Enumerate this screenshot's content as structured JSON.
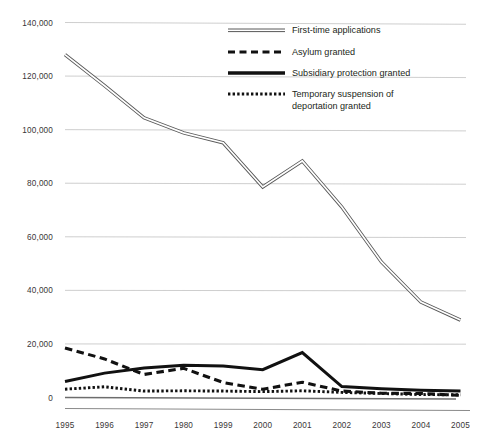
{
  "chart_data": {
    "type": "line",
    "title": "",
    "subtitle": "",
    "xlabel": "",
    "ylabel": "",
    "xlim": [
      0,
      10
    ],
    "ylim": [
      0,
      140000
    ],
    "grid": true,
    "legend_position": "top-right",
    "categories": [
      "1995",
      "1996",
      "1997",
      "1980",
      "1999",
      "2000",
      "2001",
      "2002",
      "2003",
      "2004",
      "2005"
    ],
    "ytick_labels": [
      "0",
      "20,000",
      "40,000",
      "60,000",
      "80,000",
      "100,000",
      "120,000",
      "140,000"
    ],
    "ytick_values": [
      0,
      20000,
      40000,
      60000,
      80000,
      100000,
      120000,
      140000
    ],
    "series": [
      {
        "name": "First-time applications",
        "style": "double-line",
        "values": [
          128000,
          116400,
          104400,
          98800,
          95100,
          78600,
          88300,
          71100,
          50600,
          35600,
          28900
        ]
      },
      {
        "name": "Asylum granted",
        "style": "dashed",
        "values": [
          18500,
          14400,
          8600,
          10900,
          5600,
          3100,
          5700,
          2400,
          1600,
          1500,
          800
        ]
      },
      {
        "name": "Subsidiary protection granted",
        "style": "solid",
        "values": [
          6000,
          9100,
          11000,
          12000,
          11800,
          10400,
          16800,
          4100,
          3300,
          2700,
          2400
        ]
      },
      {
        "name": "Temporary suspension of deportation granted",
        "style": "dotted",
        "values": [
          3100,
          4000,
          2400,
          2500,
          2400,
          2200,
          2500,
          1900,
          1500,
          1100,
          1000
        ]
      }
    ]
  },
  "legend": {
    "items": [
      {
        "label": "First-time applications",
        "swatch": "double-line-swatch"
      },
      {
        "label": "Asylum granted",
        "swatch": "dashed-line-swatch"
      },
      {
        "label": "Subsidiary protection granted",
        "swatch": "solid-line-swatch"
      },
      {
        "label": "Temporary suspension of",
        "label2": "deportation granted",
        "swatch": "dotted-line-swatch"
      }
    ]
  },
  "colors": {
    "gridline": "#b9b9b9",
    "axis": "#8a8a8a",
    "series_dark": "#111111",
    "series_outline": "#585858",
    "text": "#231f20",
    "background": "#ffffff"
  }
}
